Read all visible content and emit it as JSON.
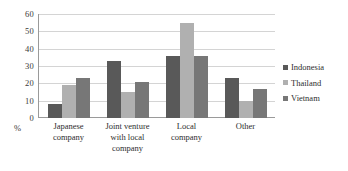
{
  "chart_data": {
    "type": "bar",
    "title": "",
    "subtitle": "",
    "xlabel": "",
    "ylabel": "%",
    "ylim": [
      0,
      60
    ],
    "yticks": [
      0,
      10,
      20,
      30,
      40,
      50,
      60
    ],
    "grid": true,
    "legend_position": "right",
    "categories": [
      "Japanese company",
      "Joint venture with local company",
      "Local company",
      "Other"
    ],
    "series": [
      {
        "name": "Indonesia",
        "color": "#595959",
        "values": [
          8,
          33,
          36,
          23
        ]
      },
      {
        "name": "Thailand",
        "color": "#b0b0b0",
        "values": [
          19,
          15,
          55,
          10
        ]
      },
      {
        "name": "Vietnam",
        "color": "#777777",
        "values": [
          23,
          21,
          36,
          17
        ]
      }
    ]
  },
  "axis": {
    "unit_label": "%",
    "tick_labels": [
      "60",
      "50",
      "40",
      "30",
      "20",
      "10",
      "0"
    ]
  },
  "categories_display": [
    [
      "Japanese",
      "company"
    ],
    [
      "Joint venture",
      "with local",
      "company"
    ],
    [
      "Local",
      "company"
    ],
    [
      "Other"
    ]
  ],
  "legend": {
    "items": [
      {
        "label": "Indonesia",
        "color": "#595959"
      },
      {
        "label": "Thailand",
        "color": "#b0b0b0"
      },
      {
        "label": "Vietnam",
        "color": "#777777"
      }
    ]
  }
}
